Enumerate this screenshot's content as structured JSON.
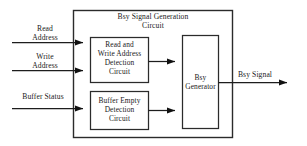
{
  "diagram": {
    "title": "Bsy Signal Generation\nCircuit",
    "outer_block_name": "Bsy Signal Generation Circuit",
    "colors": {
      "stroke": "#2b2b2b",
      "wire": "#1d1d1d",
      "text": "#1a1a1a",
      "background": "#ffffff"
    },
    "inputs": [
      {
        "label": "Read\nAddress",
        "target": "Read and Write Address Detection Circuit"
      },
      {
        "label": "Write\nAddress",
        "target": "Read and Write Address Detection Circuit"
      },
      {
        "label": "Buffer Status",
        "target": "Buffer Empty Detection Circuit"
      }
    ],
    "blocks": [
      {
        "id": "read-write-address-detection",
        "label": "Read and\nWrite Address\nDetection\nCircuit"
      },
      {
        "id": "buffer-empty-detection",
        "label": "Buffer Empty\nDetection\nCircuit"
      },
      {
        "id": "bsy-generator",
        "label": "Bsy\nGenerator"
      }
    ],
    "outputs": [
      {
        "label": "Bsy Signal",
        "source": "Bsy Generator"
      }
    ]
  }
}
